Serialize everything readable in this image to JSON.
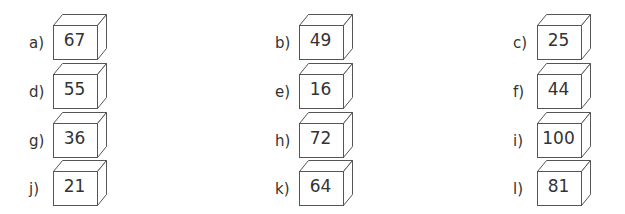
{
  "items": [
    {
      "label": "a)",
      "value": "67"
    },
    {
      "label": "b)",
      "value": "49"
    },
    {
      "label": "c)",
      "value": "25"
    },
    {
      "label": "d)",
      "value": "55"
    },
    {
      "label": "e)",
      "value": "16"
    },
    {
      "label": "f)",
      "value": "44"
    },
    {
      "label": "g)",
      "value": "36"
    },
    {
      "label": "h)",
      "value": "72"
    },
    {
      "label": "i)",
      "value": "100"
    },
    {
      "label": "j)",
      "value": "21"
    },
    {
      "label": "k)",
      "value": "64"
    },
    {
      "label": "l)",
      "value": "81"
    }
  ],
  "colors": {
    "stroke": "#555555",
    "text": "#333333"
  }
}
